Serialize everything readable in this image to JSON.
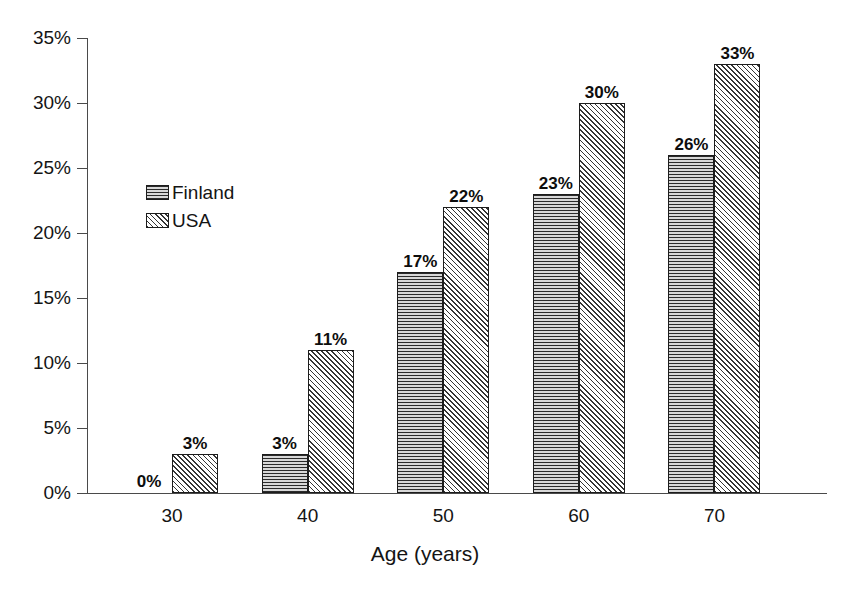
{
  "chart_data": {
    "type": "bar",
    "title": "",
    "subtitle": "",
    "xlabel": "Age (years)",
    "ylabel": "",
    "categories": [
      "30",
      "40",
      "50",
      "60",
      "70"
    ],
    "series": [
      {
        "name": "Finland",
        "pattern": "horizontal-stripes",
        "values": [
          0,
          3,
          17,
          23,
          26
        ],
        "labels": [
          "0%",
          "3%",
          "17%",
          "23%",
          "26%"
        ]
      },
      {
        "name": "USA",
        "pattern": "diagonal-hatch",
        "values": [
          3,
          11,
          22,
          30,
          33
        ],
        "labels": [
          "3%",
          "11%",
          "22%",
          "30%",
          "33%"
        ]
      }
    ],
    "ylim": [
      0,
      35
    ],
    "ytick_values": [
      0,
      5,
      10,
      15,
      20,
      25,
      30,
      35
    ],
    "ytick_labels": [
      "0%",
      "5%",
      "10%",
      "15%",
      "20%",
      "25%",
      "30%",
      "35%"
    ],
    "grid": false,
    "legend_position": "inside-upper-left",
    "value_labels_shown": true,
    "colors": {
      "axis": "#4a4a4a",
      "bar_outline": "#1c1c1c",
      "finland_fill": "#9a9a9a",
      "usa_fill": "#ffffff",
      "text": "#141414",
      "background": "#ffffff"
    }
  },
  "legend": {
    "entries": [
      {
        "label": "Finland",
        "swatch": "horizontal-stripes-swatch"
      },
      {
        "label": "USA",
        "swatch": "diagonal-hatch-swatch"
      }
    ]
  }
}
